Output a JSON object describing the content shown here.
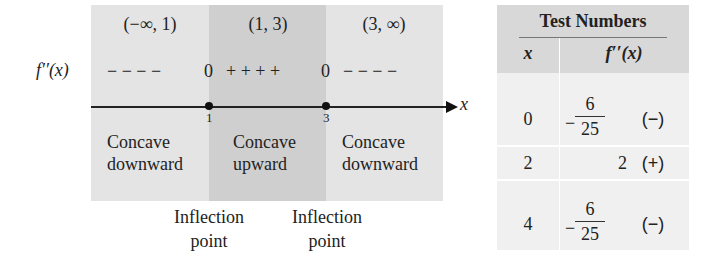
{
  "number_line": {
    "function_label": "f′′(x)",
    "axis_label": "x",
    "intervals": [
      {
        "label": "(−∞, 1)",
        "signs": "− − − −",
        "concavity_1": "Concave",
        "concavity_2": "downward"
      },
      {
        "label": "(1, 3)",
        "signs": "+ + + +",
        "concavity_1": "Concave",
        "concavity_2": "upward"
      },
      {
        "label": "(3, ∞)",
        "signs": "− − − −",
        "concavity_1": "Concave",
        "concavity_2": "downward"
      }
    ],
    "zero_marks": [
      "0",
      "0"
    ],
    "points": [
      {
        "value": "1",
        "annotation_1": "Inflection",
        "annotation_2": "point"
      },
      {
        "value": "3",
        "annotation_1": "Inflection",
        "annotation_2": "point"
      }
    ]
  },
  "table": {
    "title": "Test Numbers",
    "col_x": "x",
    "col_f": "f′′(x)",
    "rows": [
      {
        "x": "0",
        "value_neg": "−",
        "num": "6",
        "den": "25",
        "sign": "(−)"
      },
      {
        "x": "2",
        "value": "2",
        "sign": "(+)"
      },
      {
        "x": "4",
        "value_neg": "−",
        "num": "6",
        "den": "25",
        "sign": "(−)"
      }
    ]
  }
}
